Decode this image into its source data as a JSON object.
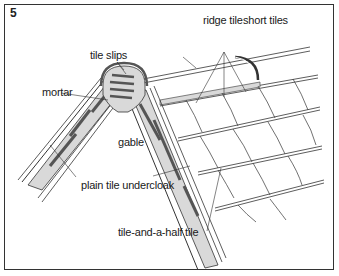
{
  "figure": {
    "number": "5",
    "labels": {
      "ridge_tile": "ridge tile",
      "short_tiles": "short tiles",
      "tile_slips": "tile slips",
      "mortar": "mortar",
      "gable": "gable",
      "plain_tile_undercloak": "plain tile undercloak",
      "tile_and_a_half_tile": "tile-and-a-half tile"
    }
  },
  "colors": {
    "line": "#333333",
    "fill_grey": "#d9d9d9",
    "dark_slip": "#555555",
    "background": "#ffffff"
  }
}
